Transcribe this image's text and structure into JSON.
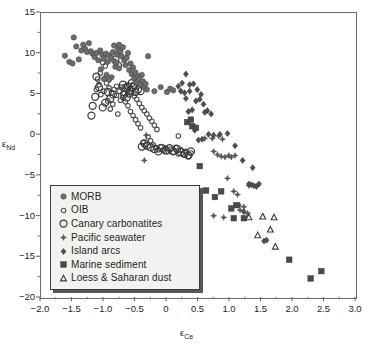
{
  "chart_data": {
    "type": "scatter",
    "title": "",
    "xlabel": "εCe",
    "ylabel": "εNd",
    "xlim": [
      -2.0,
      3.0
    ],
    "ylim": [
      -20,
      15
    ],
    "xticks": [
      "-2.0",
      "-1.5",
      "-1.0",
      "-0.5",
      "0",
      "0.5",
      "1.0",
      "1.5",
      "2.0",
      "2.5",
      "3.0"
    ],
    "xtick_values": [
      -2.0,
      -1.5,
      -1.0,
      -0.5,
      0,
      0.5,
      1.0,
      1.5,
      2.0,
      2.5,
      3.0
    ],
    "yticks": [
      "15",
      "10",
      "5",
      "0",
      "-5",
      "-10",
      "-15",
      "-20"
    ],
    "ytick_values": [
      15,
      10,
      5,
      0,
      -5,
      -10,
      -15,
      -20
    ],
    "minor_tick_step_x": 0.25,
    "minor_tick_step_y": 2.5,
    "grid": false,
    "legend_position": "lower-left",
    "series": [
      {
        "name": "MORB",
        "marker": "filled-circle",
        "color": "#6d6d6d",
        "size": 5.4,
        "points": [
          [
            -1.62,
            9.75
          ],
          [
            -1.48,
            12.0
          ],
          [
            -1.44,
            10.9
          ],
          [
            -1.4,
            9.3
          ],
          [
            -1.36,
            10.4
          ],
          [
            -1.33,
            11.1
          ],
          [
            -1.3,
            10.6
          ],
          [
            -1.27,
            10.2
          ],
          [
            -1.24,
            11.3
          ],
          [
            -1.21,
            10.3
          ],
          [
            -1.18,
            10.0
          ],
          [
            -1.15,
            9.6
          ],
          [
            -1.12,
            10.1
          ],
          [
            -1.09,
            9.2
          ],
          [
            -1.06,
            10.4
          ],
          [
            -1.03,
            9.9
          ],
          [
            -1.0,
            9.4
          ],
          [
            -0.97,
            10.0
          ],
          [
            -0.94,
            9.0
          ],
          [
            -0.92,
            9.8
          ],
          [
            -0.89,
            9.5
          ],
          [
            -0.86,
            10.2
          ],
          [
            -0.84,
            9.1
          ],
          [
            -0.82,
            8.4
          ],
          [
            -0.8,
            9.9
          ],
          [
            -0.78,
            10.6
          ],
          [
            -0.76,
            11.1
          ],
          [
            -0.74,
            10.3
          ],
          [
            -0.72,
            9.7
          ],
          [
            -0.7,
            10.8
          ],
          [
            -0.68,
            9.2
          ],
          [
            -0.66,
            8.6
          ],
          [
            -0.64,
            9.5
          ],
          [
            -0.62,
            10.1
          ],
          [
            -0.6,
            8.0
          ],
          [
            -0.58,
            8.8
          ],
          [
            -0.56,
            7.5
          ],
          [
            -0.54,
            8.3
          ],
          [
            -0.52,
            7.0
          ],
          [
            -0.5,
            7.7
          ],
          [
            -0.48,
            6.5
          ],
          [
            -0.46,
            7.2
          ],
          [
            -0.44,
            6.9
          ],
          [
            -0.42,
            6.2
          ],
          [
            -0.4,
            7.4
          ],
          [
            -0.38,
            6.6
          ],
          [
            -0.36,
            5.9
          ],
          [
            -0.34,
            6.3
          ],
          [
            -0.32,
            5.6
          ],
          [
            -0.88,
            7.1
          ],
          [
            -0.92,
            6.8
          ],
          [
            -0.96,
            7.4
          ],
          [
            -1.0,
            6.9
          ],
          [
            -1.05,
            8.1
          ],
          [
            -0.3,
            9.7
          ],
          [
            -0.2,
            5.4
          ],
          [
            -0.1,
            5.9
          ],
          [
            0.0,
            5.3
          ],
          [
            0.05,
            5.7
          ],
          [
            0.1,
            5.5
          ],
          [
            -1.55,
            9.0
          ],
          [
            -1.5,
            8.8
          ],
          [
            -0.84,
            11.0
          ],
          [
            -0.8,
            8.9
          ],
          [
            -0.76,
            8.2
          ]
        ]
      },
      {
        "name": "OIB",
        "marker": "open-circle-small",
        "color": "#4a4a4a",
        "size": 4.6,
        "points": [
          [
            -1.02,
            8.9
          ],
          [
            -0.98,
            8.5
          ],
          [
            -1.06,
            7.6
          ],
          [
            -1.1,
            6.9
          ],
          [
            -1.08,
            6.2
          ],
          [
            -1.12,
            5.6
          ],
          [
            -1.05,
            5.0
          ],
          [
            -1.0,
            5.4
          ],
          [
            -0.96,
            6.4
          ],
          [
            -0.92,
            5.8
          ],
          [
            -0.88,
            5.2
          ],
          [
            -0.84,
            5.6
          ],
          [
            -0.8,
            6.0
          ],
          [
            -0.76,
            5.4
          ],
          [
            -0.72,
            5.9
          ],
          [
            -0.68,
            5.1
          ],
          [
            -0.64,
            5.5
          ],
          [
            -0.6,
            6.1
          ],
          [
            -0.56,
            5.2
          ],
          [
            -0.52,
            4.8
          ],
          [
            -0.48,
            4.4
          ],
          [
            -0.44,
            3.9
          ],
          [
            -0.4,
            3.4
          ],
          [
            -0.36,
            3.0
          ],
          [
            -0.32,
            2.6
          ],
          [
            -0.28,
            2.1
          ],
          [
            -0.24,
            1.7
          ],
          [
            -0.2,
            1.2
          ],
          [
            -0.16,
            0.7
          ],
          [
            -0.86,
            3.8
          ],
          [
            -0.9,
            3.2
          ],
          [
            -0.94,
            4.2
          ],
          [
            -0.7,
            4.6
          ],
          [
            -0.66,
            4.1
          ],
          [
            -0.62,
            3.6
          ],
          [
            -0.58,
            2.9
          ],
          [
            -0.54,
            2.4
          ],
          [
            -0.5,
            1.9
          ],
          [
            -0.46,
            1.4
          ],
          [
            -0.42,
            0.9
          ],
          [
            -0.3,
            -0.2
          ],
          [
            -0.26,
            -0.7
          ],
          [
            -0.22,
            -1.2
          ],
          [
            -0.18,
            -1.5
          ],
          [
            -0.14,
            -1.8
          ],
          [
            -0.1,
            -1.4
          ],
          [
            -0.06,
            -1.9
          ],
          [
            -0.02,
            -1.6
          ],
          [
            0.02,
            -2.0
          ],
          [
            0.06,
            -1.7
          ],
          [
            0.1,
            -2.1
          ],
          [
            0.14,
            -1.5
          ],
          [
            0.18,
            -2.3
          ],
          [
            0.22,
            -1.8
          ],
          [
            0.26,
            -2.4
          ],
          [
            0.3,
            -2.0
          ],
          [
            0.34,
            -2.6
          ],
          [
            0.38,
            -2.2
          ],
          [
            -0.34,
            -1.3
          ],
          [
            -0.38,
            -0.9
          ],
          [
            0.18,
            -0.1
          ],
          [
            -0.8,
            4.9
          ],
          [
            -0.74,
            4.3
          ],
          [
            -0.78,
            2.6
          ]
        ]
      },
      {
        "name": "Canary carbonatites",
        "marker": "open-circle-large",
        "color": "#3a3a3a",
        "size": 7.0,
        "points": [
          [
            -1.12,
            7.2
          ],
          [
            -1.08,
            5.9
          ],
          [
            -1.14,
            4.7
          ],
          [
            -1.18,
            3.6
          ],
          [
            -1.2,
            2.4
          ],
          [
            -0.82,
            9.3
          ],
          [
            -0.78,
            8.6
          ],
          [
            -0.7,
            6.2
          ],
          [
            -0.66,
            5.8
          ],
          [
            -0.62,
            6.0
          ],
          [
            -0.58,
            5.5
          ],
          [
            -0.54,
            5.9
          ],
          [
            -0.5,
            5.3
          ],
          [
            -0.46,
            5.6
          ],
          [
            -0.42,
            5.4
          ],
          [
            -0.86,
            5.0
          ],
          [
            -0.9,
            4.5
          ],
          [
            -0.94,
            5.3
          ],
          [
            -0.98,
            4.0
          ],
          [
            -1.02,
            3.4
          ],
          [
            -0.52,
            6.1
          ],
          [
            -0.56,
            6.4
          ],
          [
            -0.6,
            5.1
          ],
          [
            -0.64,
            4.6
          ],
          [
            -0.68,
            5.0
          ],
          [
            -0.26,
            -1.5
          ],
          [
            -0.2,
            -1.7
          ],
          [
            -0.14,
            -2.0
          ],
          [
            -0.08,
            -1.6
          ],
          [
            -0.02,
            -1.9
          ],
          [
            0.04,
            -1.6
          ],
          [
            0.1,
            -2.0
          ],
          [
            0.16,
            -1.7
          ],
          [
            0.22,
            -2.1
          ],
          [
            0.28,
            -2.3
          ],
          [
            0.34,
            -2.5
          ],
          [
            -0.32,
            -1.3
          ],
          [
            -0.36,
            -1.0
          ],
          [
            -0.4,
            -1.4
          ],
          [
            0.38,
            -2.0
          ]
        ]
      },
      {
        "name": "Pacific seawater",
        "marker": "four-point-star",
        "color": "#555555",
        "size": 6.0,
        "points": [
          [
            -0.33,
            0.0
          ],
          [
            -0.36,
            -3.1
          ],
          [
            0.6,
            -0.4
          ],
          [
            0.72,
            -0.4
          ],
          [
            0.82,
            -0.1
          ],
          [
            0.88,
            -0.5
          ],
          [
            0.74,
            -2.0
          ],
          [
            0.8,
            -2.4
          ],
          [
            0.86,
            -2.6
          ],
          [
            0.92,
            -2.7
          ],
          [
            0.98,
            -2.5
          ],
          [
            1.02,
            -2.7
          ],
          [
            1.08,
            -2.5
          ],
          [
            0.96,
            -5.3
          ],
          [
            1.06,
            -6.9
          ],
          [
            1.12,
            -7.3
          ],
          [
            1.16,
            -9.2
          ],
          [
            1.22,
            -8.8
          ],
          [
            0.9,
            -10.1
          ],
          [
            0.74,
            -9.9
          ],
          [
            1.28,
            -9.6
          ],
          [
            1.3,
            -6.2
          ]
        ]
      },
      {
        "name": "Island arcs",
        "marker": "filled-diamond",
        "color": "#4d4d4d",
        "size": 6.2,
        "points": [
          [
            0.3,
            7.5
          ],
          [
            0.24,
            6.4
          ],
          [
            0.18,
            6.0
          ],
          [
            0.36,
            6.2
          ],
          [
            0.42,
            6.3
          ],
          [
            0.48,
            5.6
          ],
          [
            0.54,
            5.0
          ],
          [
            0.46,
            4.2
          ],
          [
            0.52,
            4.4
          ],
          [
            0.58,
            3.8
          ],
          [
            0.4,
            3.1
          ],
          [
            0.34,
            2.9
          ],
          [
            0.6,
            2.8
          ],
          [
            0.22,
            5.4
          ],
          [
            0.28,
            5.2
          ],
          [
            0.44,
            0.6
          ],
          [
            0.5,
            -0.6
          ],
          [
            0.56,
            -0.5
          ],
          [
            0.66,
            0.1
          ],
          [
            0.74,
            0.0
          ],
          [
            0.84,
            0.1
          ],
          [
            0.96,
            0.2
          ],
          [
            1.08,
            -1.3
          ],
          [
            1.2,
            -3.1
          ],
          [
            1.36,
            -4.0
          ],
          [
            1.3,
            -6.0
          ],
          [
            1.34,
            -6.1
          ],
          [
            1.38,
            -6.2
          ],
          [
            1.42,
            -6.3
          ],
          [
            1.46,
            -6.0
          ],
          [
            1.14,
            -8.6
          ],
          [
            1.22,
            -9.4
          ],
          [
            1.54,
            -13.0
          ],
          [
            1.58,
            -12.9
          ],
          [
            0.36,
            5.4
          ],
          [
            0.3,
            4.5
          ],
          [
            0.64,
            3.0
          ],
          [
            0.7,
            2.6
          ]
        ]
      },
      {
        "name": "Marine sediment",
        "marker": "filled-square",
        "color": "#4a4a4a",
        "size": 5.6,
        "points": [
          [
            0.32,
            1.6
          ],
          [
            0.4,
            1.1
          ],
          [
            0.46,
            0.9
          ],
          [
            0.52,
            -3.8
          ],
          [
            0.62,
            -6.8
          ],
          [
            0.76,
            -7.6
          ],
          [
            1.06,
            -10.2
          ],
          [
            1.22,
            -10.2
          ],
          [
            1.1,
            -8.6
          ],
          [
            1.02,
            -9.0
          ],
          [
            1.94,
            -15.3
          ],
          [
            2.28,
            -17.6
          ],
          [
            2.45,
            -16.7
          ],
          [
            0.86,
            -6.9
          ],
          [
            0.38,
            1.9
          ]
        ]
      },
      {
        "name": "Loess & Saharan dust",
        "marker": "open-triangle",
        "color": "#3a3a3a",
        "size": 6.4,
        "points": [
          [
            1.3,
            -10.1
          ],
          [
            1.52,
            -10.0
          ],
          [
            1.64,
            -11.6
          ],
          [
            1.44,
            -12.3
          ],
          [
            1.72,
            -13.7
          ],
          [
            1.7,
            -10.1
          ]
        ]
      }
    ]
  },
  "legend": {
    "items": [
      {
        "label": "MORB",
        "marker": "filled-circle"
      },
      {
        "label": "OIB",
        "marker": "open-circle-small"
      },
      {
        "label": "Canary carbonatites",
        "marker": "open-circle-large"
      },
      {
        "label": "Pacific seawater",
        "marker": "four-point-star"
      },
      {
        "label": "Island arcs",
        "marker": "filled-diamond"
      },
      {
        "label": "Marine sediment",
        "marker": "filled-square"
      },
      {
        "label": "Loess & Saharan dust",
        "marker": "open-triangle"
      }
    ]
  },
  "colors": {
    "frame": "#6b6b6b",
    "text": "#231f20",
    "legend_bg": "#f2f2f0",
    "background": "#ffffff"
  }
}
